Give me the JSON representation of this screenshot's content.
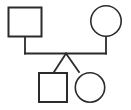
{
  "canvas": {
    "width": 131,
    "height": 110,
    "background": "#ffffff",
    "title": "Family genogram"
  },
  "style": {
    "stroke_color": "#2b2b2b",
    "fill_color": "none",
    "square_stroke_width": 2,
    "circle_stroke_width": 1.6,
    "link_stroke_width": 1.6
  },
  "diagram": {
    "type": "genogram",
    "nodes": [
      {
        "id": "father",
        "role": "parent",
        "gender": "male",
        "shape": "square",
        "label": "",
        "x": 7.5,
        "y": 6.5,
        "width": 35,
        "height": 31
      },
      {
        "id": "mother",
        "role": "parent",
        "gender": "female",
        "shape": "circle",
        "label": "",
        "cx": 106,
        "cy": 21,
        "r": 16
      },
      {
        "id": "child-son",
        "role": "child",
        "gender": "male",
        "shape": "square",
        "label": "",
        "x": 38,
        "y": 72,
        "width": 30,
        "height": 31
      },
      {
        "id": "child-daughter",
        "role": "child",
        "gender": "female",
        "shape": "circle",
        "label": "",
        "cx": 90,
        "cy": 87.5,
        "r": 15.5
      }
    ],
    "links": [
      {
        "id": "father-descender",
        "type": "parent-drop",
        "points": "25,37.5 25,53.5"
      },
      {
        "id": "partnership-line",
        "type": "partnership",
        "points": "25,53.5 106,53.5"
      },
      {
        "id": "mother-descender",
        "type": "parent-drop",
        "points": "106,37 106,53.5"
      },
      {
        "id": "sibling-fork-left",
        "type": "sibling",
        "points": "66,53.5 54,72"
      },
      {
        "id": "sibling-fork-right",
        "type": "sibling",
        "points": "66,53.5 79,72"
      }
    ]
  }
}
